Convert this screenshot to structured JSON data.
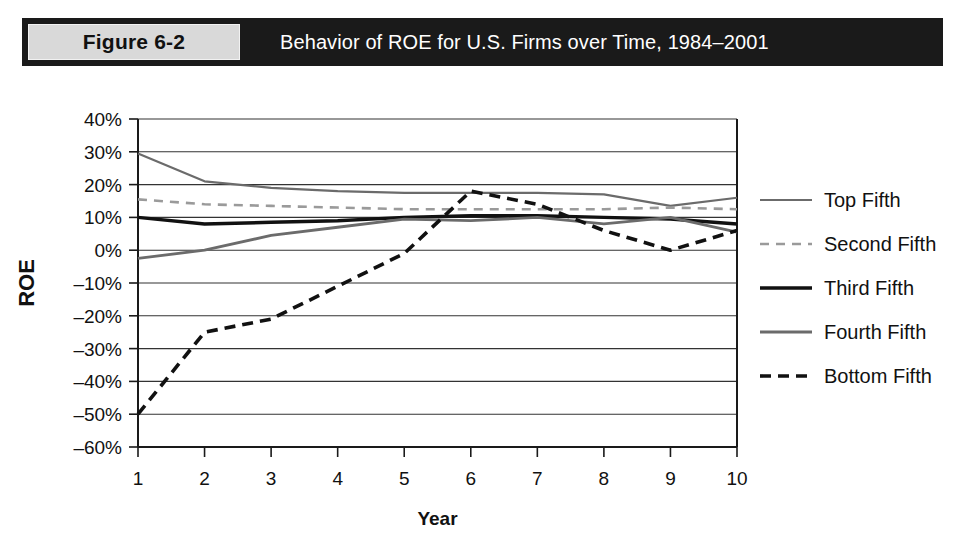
{
  "figure": {
    "tag": "Figure 6-2",
    "title": "Behavior of ROE for U.S. Firms over Time, 1984–2001"
  },
  "chart_data": {
    "type": "line",
    "title": "Behavior of ROE for U.S. Firms over Time, 1984–2001",
    "xlabel": "Year",
    "ylabel": "ROE",
    "x": [
      1,
      2,
      3,
      4,
      5,
      6,
      7,
      8,
      9,
      10
    ],
    "xtick_labels": [
      "1",
      "2",
      "3",
      "4",
      "5",
      "6",
      "7",
      "8",
      "9",
      "10"
    ],
    "ytick_labels": [
      "40%",
      "30%",
      "20%",
      "10%",
      "0%",
      "–10%",
      "–20%",
      "–30%",
      "–40%",
      "–50%",
      "–60%"
    ],
    "ytick_values": [
      40,
      30,
      20,
      10,
      0,
      -10,
      -20,
      -30,
      -40,
      -50,
      -60
    ],
    "ylim": [
      -60,
      40
    ],
    "xlim": [
      1,
      10
    ],
    "grid": true,
    "legend_position": "right",
    "series": [
      {
        "name": "Top Fifth",
        "style": "solid",
        "color": "#6b6b6b",
        "width": 2.2,
        "values": [
          29.5,
          21.0,
          19.0,
          18.0,
          17.5,
          17.5,
          17.5,
          17.0,
          13.5,
          16.0
        ]
      },
      {
        "name": "Second Fifth",
        "style": "dashed",
        "color": "#9a9a9a",
        "width": 2.6,
        "values": [
          15.5,
          14.0,
          13.5,
          13.0,
          12.5,
          12.5,
          12.5,
          12.5,
          13.0,
          12.5
        ]
      },
      {
        "name": "Third Fifth",
        "style": "solid",
        "color": "#111111",
        "width": 3.4,
        "values": [
          10.0,
          8.0,
          8.5,
          9.0,
          10.0,
          10.5,
          10.5,
          10.0,
          9.5,
          8.0
        ]
      },
      {
        "name": "Fourth Fifth",
        "style": "solid",
        "color": "#6b6b6b",
        "width": 2.8,
        "values": [
          -2.5,
          0.0,
          4.5,
          7.0,
          9.5,
          9.0,
          10.0,
          8.0,
          10.0,
          5.5
        ]
      },
      {
        "name": "Bottom Fifth",
        "style": "dashed",
        "color": "#111111",
        "width": 3.6,
        "values": [
          -50.0,
          -25.0,
          -21.0,
          -11.0,
          -1.0,
          18.0,
          14.0,
          6.0,
          0.0,
          6.0
        ]
      }
    ]
  }
}
